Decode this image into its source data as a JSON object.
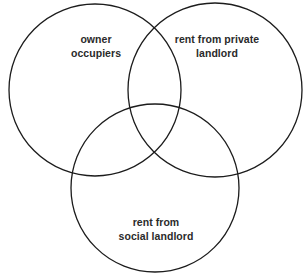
{
  "diagram": {
    "type": "venn-3-circle",
    "background_color": "#ffffff",
    "stroke_color": "#1c1c1c",
    "text_color": "#2a2a2a",
    "sets": [
      {
        "id": "owner-occupiers",
        "label": "owner\noccupiers",
        "position": "top-left",
        "center_x": 95,
        "center_y": 90,
        "radius": 86
      },
      {
        "id": "private-landlord",
        "label": "rent from private\nlandlord",
        "position": "top-right",
        "center_x": 215,
        "center_y": 90,
        "radius": 87
      },
      {
        "id": "social-landlord",
        "label": "rent from\nsocial landlord",
        "position": "bottom-center",
        "center_x": 155,
        "center_y": 188,
        "radius": 84
      }
    ]
  }
}
